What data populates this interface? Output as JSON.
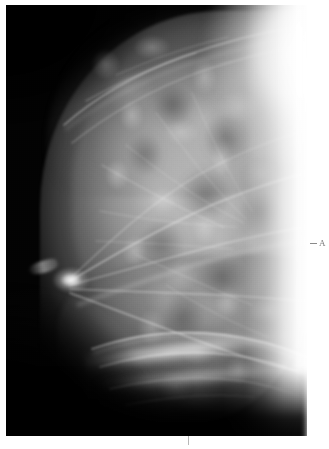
{
  "page": {
    "background_color": "#ffffff",
    "width": 329,
    "height": 449
  },
  "image": {
    "modality": "mammogram",
    "view": "craniocaudal",
    "background_color": "#000000",
    "left": 6,
    "top": 5,
    "width": 301,
    "height": 431
  },
  "annotations": {
    "right_marker": {
      "label": "A",
      "color": "#7a7a7a",
      "x": 320,
      "y": 246
    },
    "bottom_tick": {
      "label": "",
      "color": "#b8b8b8",
      "x": 188,
      "y": 440
    }
  },
  "regions": {
    "chest_wall": "bright-pectoral-region",
    "nipple": "nipple-marker",
    "fibroglandular": "dense-parenchyma",
    "inframammary_fold": "bright-fibrous-band",
    "background": "dark-air-field"
  }
}
